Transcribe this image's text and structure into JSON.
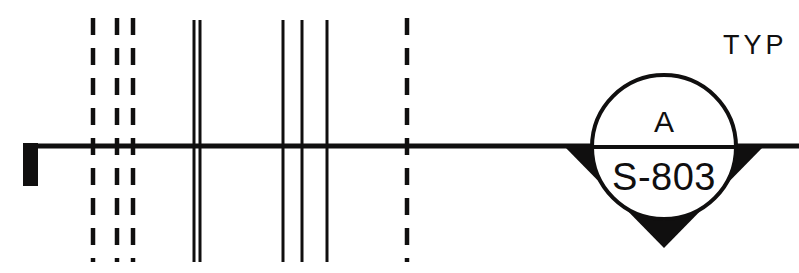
{
  "drawing": {
    "type": "section-cut-callout",
    "colors": {
      "ink": "#100f0f",
      "background": "#ffffff"
    },
    "cut_line": {
      "name": "section-cut-line",
      "y": 146,
      "x_start": 23,
      "x_end": 799,
      "thickness": 5
    },
    "tail_flag": {
      "name": "cut-line-left-tail",
      "x": 23,
      "y": 143,
      "width": 15,
      "height": 43
    },
    "grid_lines": [
      {
        "name": "grid-dashed-1",
        "x": 93,
        "style": "dashed",
        "y_top": 18,
        "y_bottom": 262
      },
      {
        "name": "grid-dashed-2",
        "x": 117,
        "style": "dashed",
        "y_top": 18,
        "y_bottom": 262
      },
      {
        "name": "grid-dashed-3",
        "x": 133,
        "style": "dashed",
        "y_top": 18,
        "y_bottom": 262
      },
      {
        "name": "grid-solid-double-a",
        "x": 194,
        "style": "solid",
        "y_top": 20,
        "y_bottom": 262
      },
      {
        "name": "grid-solid-double-b",
        "x": 200,
        "style": "solid",
        "y_top": 20,
        "y_bottom": 262
      },
      {
        "name": "grid-solid-1",
        "x": 283,
        "style": "solid",
        "y_top": 20,
        "y_bottom": 262
      },
      {
        "name": "grid-solid-2",
        "x": 302,
        "style": "solid",
        "y_top": 20,
        "y_bottom": 262
      },
      {
        "name": "grid-solid-3",
        "x": 327,
        "style": "solid",
        "y_top": 20,
        "y_bottom": 262
      },
      {
        "name": "grid-dashed-4",
        "x": 407,
        "style": "dashed",
        "y_top": 18,
        "y_bottom": 262
      }
    ],
    "callout": {
      "name": "section-callout-bubble",
      "circle": {
        "cx": 664,
        "cy": 147,
        "r": 72,
        "stroke": 4
      },
      "arrow": {
        "name": "section-direction-arrow",
        "points": "563,145 765,145 664,248"
      },
      "divider_y": 147,
      "top_text": "A",
      "bottom_text": "S-803"
    },
    "annotation": {
      "name": "typ-annotation",
      "text": "TYP",
      "x": 723,
      "y": 54
    }
  }
}
